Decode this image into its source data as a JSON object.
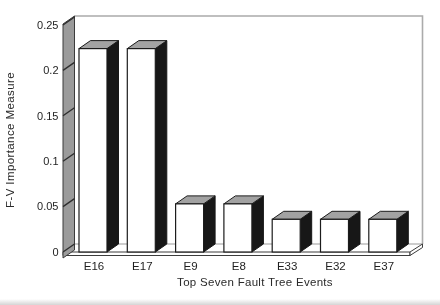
{
  "chart_data": {
    "type": "bar",
    "style": "3d-column",
    "title": "",
    "xlabel": "Top Seven Fault Tree Events",
    "ylabel": "F-V Importance Measure",
    "categories": [
      "E16",
      "E17",
      "E9",
      "E8",
      "E33",
      "E32",
      "E37"
    ],
    "values": [
      0.224,
      0.224,
      0.053,
      0.053,
      0.036,
      0.036,
      0.036
    ],
    "ylim": [
      0,
      0.25
    ],
    "yticks": [
      0,
      0.05,
      0.1,
      0.15,
      0.2,
      0.25
    ],
    "ytick_labels": [
      "0",
      "0.05",
      "0.1",
      "0.15",
      "0.2",
      "0.25"
    ],
    "grid": false,
    "legend": null,
    "colors": {
      "background": "#ffffff",
      "bar_front": "#ffffff",
      "bar_top": "#a2a2a2",
      "bar_side": "#171717",
      "bar_outline": "#1c1c1c",
      "axis_band": "#9b9b9b",
      "axis_band_outline": "#3c3c3c",
      "tick_mark": "#2e2e2e",
      "back_wall_line": "#ababab",
      "floor_line": "#9b9b9b",
      "text": "#1e1e1e"
    }
  }
}
